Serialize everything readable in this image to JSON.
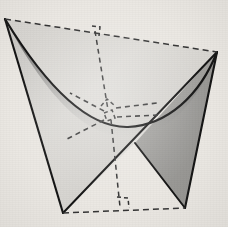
{
  "figure": {
    "title": "Hyperbolic paraboloid (saddle surface)",
    "kind": "geometry-diagram",
    "background_color": "#ebe8e3",
    "stroke_color": "#1a1a1a",
    "dash_color": "#2b2b2b",
    "surface_colors": {
      "dark": "#4a4a4a",
      "mid": "#9a9a9a",
      "light": "#e2e0dc",
      "front_panel": "#8f8f8f"
    },
    "vertices": {
      "top_left": {
        "label": "A",
        "x": 5,
        "y": 19
      },
      "top_right": {
        "label": "B",
        "x": 217,
        "y": 52
      },
      "bottom_left": {
        "label": "C",
        "x": 63,
        "y": 213
      },
      "bottom_right": {
        "label": "D",
        "x": 185,
        "y": 208
      },
      "saddle_point": {
        "label": "S",
        "x": 110,
        "y": 115
      },
      "edge_crossing": {
        "label": "X",
        "x": 135,
        "y": 143
      },
      "top_foot": {
        "label": "T",
        "x": 95,
        "y": 31
      },
      "bottom_foot": {
        "label": "U",
        "x": 120,
        "y": 207
      }
    },
    "solid_edges": [
      {
        "name": "left-ruling-edge",
        "from": "top_left",
        "to": "bottom_left"
      },
      {
        "name": "right-ruling-edge",
        "from": "top_right",
        "to": "bottom_right"
      },
      {
        "name": "front-diagonal-left",
        "from": "bottom_left",
        "to": "top_right"
      },
      {
        "name": "front-diagonal-right",
        "from": "bottom_right",
        "to": "edge_crossing"
      },
      {
        "name": "upper-parabolic-arc",
        "from": "top_left",
        "to": "top_right"
      }
    ],
    "dashed_edges": [
      {
        "name": "top-hidden-edge",
        "from": "top_left",
        "to": "top_right"
      },
      {
        "name": "bottom-hidden-edge",
        "from": "bottom_left",
        "to": "bottom_right"
      },
      {
        "name": "vertical-axis",
        "from": "top_foot",
        "to": "bottom_foot"
      }
    ],
    "tangent_rays": [
      {
        "name": "tangent-ray-upper-left",
        "angle_deg": 208
      },
      {
        "name": "tangent-ray-lower-left",
        "angle_deg": 152
      },
      {
        "name": "tangent-ray-right-upper",
        "angle_deg": 352
      },
      {
        "name": "tangent-ray-right-lower",
        "angle_deg": 6
      }
    ],
    "right_angle_marks": [
      {
        "name": "right-angle-top",
        "x": 95,
        "y": 31
      },
      {
        "name": "right-angle-center-upper",
        "x": 108,
        "y": 103
      },
      {
        "name": "right-angle-center",
        "x": 110,
        "y": 116
      },
      {
        "name": "right-angle-bottom",
        "x": 120,
        "y": 207
      }
    ]
  }
}
